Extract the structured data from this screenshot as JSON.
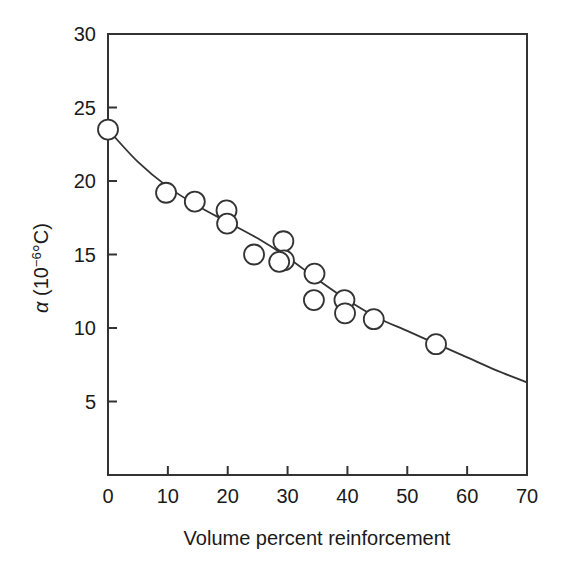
{
  "chart_data": {
    "type": "scatter",
    "title": "",
    "subtitle": "",
    "xlabel": "Volume percent reinforcement",
    "ylabel_parts": {
      "symbol": "α",
      "open_paren": " (10",
      "exponent": "−6",
      "unit": "°C)",
      "full": "α (10−6°C)"
    },
    "ylabel": "α (10−6°C)",
    "xlim": [
      0,
      70
    ],
    "ylim": [
      0,
      30
    ],
    "xticks": [
      0,
      10,
      20,
      30,
      40,
      50,
      60,
      70
    ],
    "yticks": [
      5,
      10,
      15,
      20,
      25,
      30
    ],
    "xtick_labels": [
      "0",
      "10",
      "20",
      "30",
      "40",
      "50",
      "60",
      "70"
    ],
    "ytick_labels": [
      "5",
      "10",
      "15",
      "20",
      "25",
      "30"
    ],
    "grid": false,
    "legend": null,
    "legend_position": "none",
    "marker_style": "open-circle",
    "marker_radius_px": 10,
    "line_color": "#333333",
    "marker_color": "#333333",
    "axis_color": "#333333",
    "points": [
      {
        "x": 0.0,
        "y": 23.5
      },
      {
        "x": 9.7,
        "y": 19.2
      },
      {
        "x": 14.5,
        "y": 18.6
      },
      {
        "x": 19.8,
        "y": 18.0
      },
      {
        "x": 19.9,
        "y": 17.1
      },
      {
        "x": 24.4,
        "y": 15.0
      },
      {
        "x": 29.3,
        "y": 15.9
      },
      {
        "x": 29.4,
        "y": 14.6
      },
      {
        "x": 28.6,
        "y": 14.5
      },
      {
        "x": 34.5,
        "y": 13.7
      },
      {
        "x": 34.4,
        "y": 11.9
      },
      {
        "x": 39.5,
        "y": 11.9
      },
      {
        "x": 39.6,
        "y": 11.0
      },
      {
        "x": 44.4,
        "y": 10.6
      },
      {
        "x": 54.8,
        "y": 8.9
      }
    ],
    "curve": [
      {
        "x": 0.0,
        "y": 23.5
      },
      {
        "x": 5.0,
        "y": 21.3
      },
      {
        "x": 10.0,
        "y": 19.6
      },
      {
        "x": 15.0,
        "y": 18.3
      },
      {
        "x": 20.0,
        "y": 17.2
      },
      {
        "x": 25.0,
        "y": 16.1
      },
      {
        "x": 30.0,
        "y": 14.8
      },
      {
        "x": 35.0,
        "y": 13.3
      },
      {
        "x": 40.0,
        "y": 11.9
      },
      {
        "x": 45.0,
        "y": 10.7
      },
      {
        "x": 50.0,
        "y": 9.8
      },
      {
        "x": 55.0,
        "y": 8.9
      },
      {
        "x": 60.0,
        "y": 8.0
      },
      {
        "x": 65.0,
        "y": 7.1
      },
      {
        "x": 70.0,
        "y": 6.3
      }
    ]
  },
  "figure": {
    "background_color": "#ffffff",
    "frame": {
      "left_px": 108,
      "right_px": 527,
      "top_px": 34,
      "bottom_px": 475
    }
  }
}
